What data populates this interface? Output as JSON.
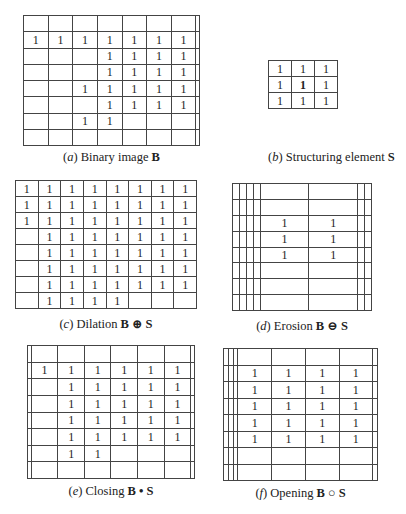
{
  "panels": [
    {
      "id": "a",
      "label": "a",
      "caption_text": "Binary image",
      "caption_math": "B",
      "rows": 8,
      "cols": 8,
      "ones": [
        [
          1,
          0
        ],
        [
          1,
          1
        ],
        [
          1,
          2
        ],
        [
          1,
          3
        ],
        [
          1,
          4
        ],
        [
          1,
          5
        ],
        [
          1,
          6
        ],
        [
          2,
          3
        ],
        [
          2,
          4
        ],
        [
          2,
          5
        ],
        [
          2,
          6
        ],
        [
          3,
          3
        ],
        [
          3,
          4
        ],
        [
          3,
          5
        ],
        [
          3,
          6
        ],
        [
          4,
          2
        ],
        [
          4,
          3
        ],
        [
          4,
          4
        ],
        [
          4,
          5
        ],
        [
          4,
          6
        ],
        [
          5,
          3
        ],
        [
          5,
          4
        ],
        [
          5,
          5
        ],
        [
          5,
          6
        ],
        [
          6,
          2
        ],
        [
          6,
          3
        ]
      ],
      "box": {
        "x": 23,
        "y": 15,
        "w": 177,
        "h": 130,
        "cy": 150
      }
    },
    {
      "id": "b",
      "label": "b",
      "caption_text": "Structuring element",
      "caption_math": "S",
      "rows": 3,
      "cols": 3,
      "ones": [
        [
          0,
          0
        ],
        [
          0,
          1
        ],
        [
          0,
          2
        ],
        [
          1,
          0
        ],
        [
          1,
          1
        ],
        [
          1,
          2
        ],
        [
          2,
          0
        ],
        [
          2,
          1
        ],
        [
          2,
          2
        ]
      ],
      "bold_cells": [
        [
          1,
          1
        ]
      ],
      "box": {
        "x": 268,
        "y": 60,
        "w": 70,
        "h": 48,
        "cy": 150
      }
    },
    {
      "id": "c",
      "label": "c",
      "caption_text": "Dilation",
      "caption_math": "B ⊕ S",
      "rows": 8,
      "cols": 8,
      "ones": [
        [
          0,
          0
        ],
        [
          0,
          1
        ],
        [
          0,
          2
        ],
        [
          0,
          3
        ],
        [
          0,
          4
        ],
        [
          0,
          5
        ],
        [
          0,
          6
        ],
        [
          0,
          7
        ],
        [
          1,
          0
        ],
        [
          1,
          1
        ],
        [
          1,
          2
        ],
        [
          1,
          3
        ],
        [
          1,
          4
        ],
        [
          1,
          5
        ],
        [
          1,
          6
        ],
        [
          1,
          7
        ],
        [
          2,
          0
        ],
        [
          2,
          1
        ],
        [
          2,
          2
        ],
        [
          2,
          3
        ],
        [
          2,
          4
        ],
        [
          2,
          5
        ],
        [
          2,
          6
        ],
        [
          2,
          7
        ],
        [
          3,
          1
        ],
        [
          3,
          2
        ],
        [
          3,
          3
        ],
        [
          3,
          4
        ],
        [
          3,
          5
        ],
        [
          3,
          6
        ],
        [
          3,
          7
        ],
        [
          4,
          1
        ],
        [
          4,
          2
        ],
        [
          4,
          3
        ],
        [
          4,
          4
        ],
        [
          4,
          5
        ],
        [
          4,
          6
        ],
        [
          4,
          7
        ],
        [
          5,
          1
        ],
        [
          5,
          2
        ],
        [
          5,
          3
        ],
        [
          5,
          4
        ],
        [
          5,
          5
        ],
        [
          5,
          6
        ],
        [
          5,
          7
        ],
        [
          6,
          1
        ],
        [
          6,
          2
        ],
        [
          6,
          3
        ],
        [
          6,
          4
        ],
        [
          6,
          5
        ],
        [
          6,
          6
        ],
        [
          6,
          7
        ],
        [
          7,
          1
        ],
        [
          7,
          2
        ],
        [
          7,
          3
        ],
        [
          7,
          4
        ]
      ],
      "box": {
        "x": 15,
        "y": 180,
        "w": 182,
        "h": 128,
        "cy": 316
      }
    },
    {
      "id": "d",
      "label": "d",
      "caption_text": "Erosion",
      "caption_math": "B ⊖ S",
      "rows": 8,
      "cols": 8,
      "ones": [
        [
          2,
          4
        ],
        [
          2,
          5
        ],
        [
          3,
          4
        ],
        [
          3,
          5
        ],
        [
          4,
          4
        ],
        [
          4,
          5
        ]
      ],
      "box": {
        "x": 232,
        "y": 183,
        "w": 140,
        "h": 127,
        "cy": 318
      }
    },
    {
      "id": "e",
      "label": "e",
      "caption_text": "Closing",
      "caption_math": "B • S",
      "rows": 8,
      "cols": 8,
      "ones": [
        [
          1,
          1
        ],
        [
          1,
          2
        ],
        [
          1,
          3
        ],
        [
          1,
          4
        ],
        [
          1,
          5
        ],
        [
          1,
          6
        ],
        [
          2,
          2
        ],
        [
          2,
          3
        ],
        [
          2,
          4
        ],
        [
          2,
          5
        ],
        [
          2,
          6
        ],
        [
          3,
          2
        ],
        [
          3,
          3
        ],
        [
          3,
          4
        ],
        [
          3,
          5
        ],
        [
          3,
          6
        ],
        [
          4,
          2
        ],
        [
          4,
          3
        ],
        [
          4,
          4
        ],
        [
          4,
          5
        ],
        [
          4,
          6
        ],
        [
          5,
          2
        ],
        [
          5,
          3
        ],
        [
          5,
          4
        ],
        [
          5,
          5
        ],
        [
          5,
          6
        ],
        [
          6,
          2
        ],
        [
          6,
          3
        ]
      ],
      "box": {
        "x": 27,
        "y": 345,
        "w": 168,
        "h": 133,
        "cy": 484
      }
    },
    {
      "id": "f",
      "label": "f",
      "caption_text": "Opening",
      "caption_math": "B ○ S",
      "rows": 8,
      "cols": 8,
      "ones": [
        [
          1,
          3
        ],
        [
          1,
          4
        ],
        [
          1,
          5
        ],
        [
          1,
          6
        ],
        [
          2,
          3
        ],
        [
          2,
          4
        ],
        [
          2,
          5
        ],
        [
          2,
          6
        ],
        [
          3,
          3
        ],
        [
          3,
          4
        ],
        [
          3,
          5
        ],
        [
          3,
          6
        ],
        [
          4,
          3
        ],
        [
          4,
          4
        ],
        [
          4,
          5
        ],
        [
          4,
          6
        ],
        [
          5,
          3
        ],
        [
          5,
          4
        ],
        [
          5,
          5
        ],
        [
          5,
          6
        ]
      ],
      "box": {
        "x": 223,
        "y": 348,
        "w": 155,
        "h": 132,
        "cy": 486
      }
    }
  ],
  "cell_value": "1"
}
